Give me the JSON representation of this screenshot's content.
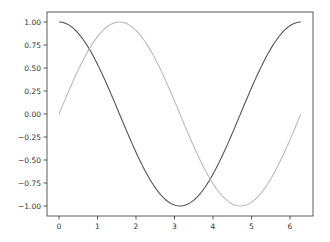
{
  "chart_data": {
    "type": "line",
    "title": "",
    "xlabel": "",
    "ylabel": "",
    "xlim": [
      -0.31,
      6.59
    ],
    "ylim": [
      -1.1,
      1.1
    ],
    "grid": false,
    "legend": null,
    "x_ticks": [
      0,
      1,
      2,
      3,
      4,
      5,
      6
    ],
    "x_tick_labels": [
      "0",
      "1",
      "2",
      "3",
      "4",
      "5",
      "6"
    ],
    "y_ticks": [
      1.0,
      0.75,
      0.5,
      0.25,
      0.0,
      -0.25,
      -0.5,
      -0.75,
      -1.0
    ],
    "y_tick_labels": [
      "1.00",
      "0.75",
      "0.50",
      "0.25",
      "0.00",
      "−0.25",
      "−0.50",
      "−0.75",
      "−1.00"
    ],
    "series": [
      {
        "name": "cos(x)",
        "color": "#555555",
        "x": [
          0,
          0.5,
          1,
          1.5,
          2,
          2.5,
          3,
          3.14,
          3.5,
          4,
          4.5,
          5,
          5.5,
          6,
          6.28
        ],
        "values": [
          1.0,
          0.878,
          0.54,
          0.071,
          -0.416,
          -0.801,
          -0.99,
          -1.0,
          -0.936,
          -0.654,
          -0.211,
          0.284,
          0.709,
          0.96,
          1.0
        ]
      },
      {
        "name": "sin(x)",
        "color": "#bbbbbb",
        "x": [
          0,
          0.5,
          1,
          1.5,
          1.57,
          2,
          2.5,
          3,
          3.5,
          4,
          4.5,
          4.71,
          5,
          5.5,
          6,
          6.28
        ],
        "values": [
          0.0,
          0.479,
          0.841,
          0.997,
          1.0,
          0.909,
          0.598,
          0.141,
          -0.351,
          -0.757,
          -0.978,
          -1.0,
          -0.959,
          -0.706,
          -0.279,
          0.0
        ]
      }
    ]
  },
  "style": {
    "frame_color": "#333333",
    "background": "#ffffff"
  }
}
